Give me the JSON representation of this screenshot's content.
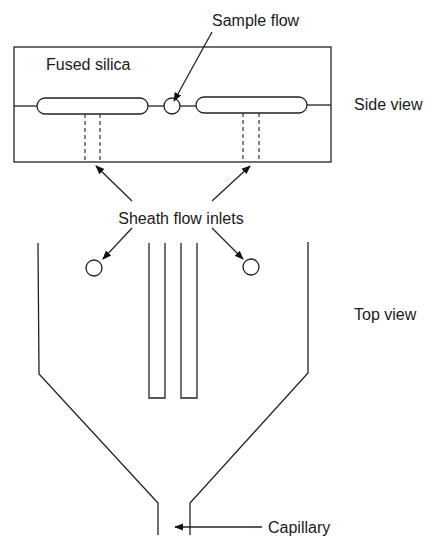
{
  "diagram": {
    "labels": {
      "sample_flow": "Sample flow",
      "fused_silica": "Fused silica",
      "side_view": "Side view",
      "sheath_flow_inlets": "Sheath flow inlets",
      "top_view": "Top view",
      "capillary": "Capillary"
    },
    "colors": {
      "line": "#222222",
      "background": "#ffffff",
      "text": "#1a1a1a"
    }
  }
}
